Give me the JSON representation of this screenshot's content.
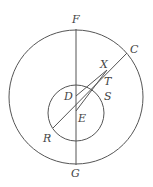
{
  "diagram": {
    "type": "geometry",
    "stroke_color": "#555555",
    "label_color": "#444444",
    "outer_circle": {
      "cx": 76,
      "cy": 97,
      "r": 67
    },
    "inner_circle": {
      "cx": 76,
      "cy": 113,
      "r": 28
    },
    "points": {
      "F": {
        "x": 76,
        "y": 29
      },
      "G": {
        "x": 76,
        "y": 165
      },
      "C": {
        "x": 127,
        "y": 53
      },
      "R": {
        "x": 53,
        "y": 128
      },
      "D": {
        "x": 76,
        "y": 96
      },
      "E": {
        "x": 76,
        "y": 111
      },
      "X": {
        "x": 107,
        "y": 70
      }
    },
    "labels": {
      "F": "F",
      "C": "C",
      "X": "X",
      "T": "T",
      "D": "D",
      "S": "S",
      "E": "E",
      "R": "R",
      "G": "G"
    }
  }
}
